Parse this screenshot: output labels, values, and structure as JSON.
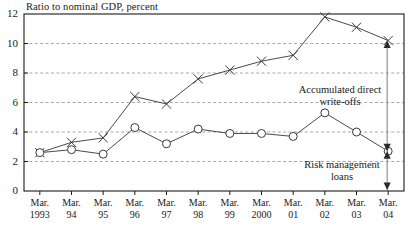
{
  "chart_data": {
    "type": "line",
    "title": "Ratio to nominal GDP, percent",
    "xlabel": "",
    "ylabel": "",
    "ylim": [
      0,
      12
    ],
    "yticks": [
      0,
      2,
      4,
      6,
      8,
      10,
      12
    ],
    "grid": "horizontal dashed at 2,4,6,8,10",
    "legend": "none (inline annotations with arrows)",
    "categories": [
      "Mar.\n1993",
      "Mar.\n94",
      "Mar.\n95",
      "Mar.\n96",
      "Mar.\n97",
      "Mar.\n98",
      "Mar.\n99",
      "Mar.\n2000",
      "Mar.\n01",
      "Mar.\n02",
      "Mar.\n03",
      "Mar.\n04"
    ],
    "x_tick_top": [
      "Mar.",
      "Mar.",
      "Mar.",
      "Mar.",
      "Mar.",
      "Mar.",
      "Mar.",
      "Mar.",
      "Mar.",
      "Mar.",
      "Mar.",
      "Mar."
    ],
    "x_tick_bottom": [
      "1993",
      "94",
      "95",
      "96",
      "97",
      "98",
      "99",
      "2000",
      "01",
      "02",
      "03",
      "04"
    ],
    "series": [
      {
        "name": "Accumulated direct write-offs",
        "marker": "cross",
        "values": [
          2.6,
          3.3,
          3.6,
          6.4,
          5.9,
          7.6,
          8.2,
          8.8,
          9.2,
          11.8,
          11.1,
          10.2
        ]
      },
      {
        "name": "Risk management loans",
        "marker": "circle",
        "values": [
          2.6,
          2.8,
          2.5,
          4.3,
          3.2,
          4.2,
          3.9,
          3.9,
          3.7,
          5.3,
          4.0,
          2.7
        ]
      }
    ],
    "annotations": [
      {
        "id": "writeoffs",
        "line1": "Accumulated direct",
        "line2": "write-offs"
      },
      {
        "id": "rml",
        "line1": "Risk management",
        "line2": "loans"
      }
    ],
    "colors": {
      "axis": "#1a1a1a",
      "gridline": "#9aa0a6",
      "series_line": "#4a4a4a",
      "marker_stroke": "#3a3a3a",
      "marker_fill": "#ffffff",
      "background": "#ffffff",
      "annotation_arrow": "#2b2b2b"
    }
  }
}
